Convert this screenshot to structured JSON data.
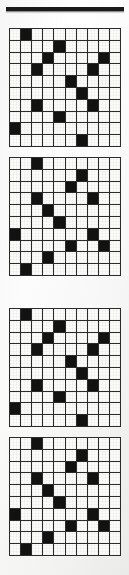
{
  "page": {
    "background_color": "#ffffff",
    "rule_color": "#1a1a1a"
  },
  "top_rule": {
    "label": "horizontal-rule"
  },
  "grid_defaults": {
    "rows": 10,
    "cols": 10,
    "filled_color": "#121212",
    "empty_color": "#fbfbfa",
    "line_color": "#2b2b2b"
  },
  "grids": [
    {
      "label": "grid-1",
      "pattern_name": "pattern-a",
      "rows": 10,
      "cols": 10,
      "filled_cells": [
        [
          0,
          1
        ],
        [
          1,
          4
        ],
        [
          2,
          3
        ],
        [
          2,
          8
        ],
        [
          3,
          2
        ],
        [
          3,
          7
        ],
        [
          4,
          5
        ],
        [
          5,
          6
        ],
        [
          6,
          2
        ],
        [
          6,
          7
        ],
        [
          7,
          4
        ],
        [
          8,
          0
        ],
        [
          9,
          6
        ]
      ]
    },
    {
      "label": "grid-2",
      "pattern_name": "pattern-b",
      "rows": 10,
      "cols": 10,
      "filled_cells": [
        [
          0,
          2
        ],
        [
          1,
          6
        ],
        [
          2,
          5
        ],
        [
          3,
          2
        ],
        [
          3,
          7
        ],
        [
          4,
          3
        ],
        [
          5,
          4
        ],
        [
          6,
          0
        ],
        [
          6,
          7
        ],
        [
          7,
          5
        ],
        [
          7,
          8
        ],
        [
          8,
          3
        ],
        [
          9,
          1
        ]
      ]
    },
    {
      "label": "grid-3",
      "pattern_name": "pattern-a",
      "rows": 10,
      "cols": 10,
      "filled_cells": [
        [
          0,
          1
        ],
        [
          1,
          4
        ],
        [
          2,
          3
        ],
        [
          2,
          8
        ],
        [
          3,
          2
        ],
        [
          3,
          7
        ],
        [
          4,
          5
        ],
        [
          5,
          6
        ],
        [
          6,
          2
        ],
        [
          6,
          7
        ],
        [
          7,
          4
        ],
        [
          8,
          0
        ],
        [
          9,
          6
        ]
      ]
    },
    {
      "label": "grid-4",
      "pattern_name": "pattern-b",
      "rows": 10,
      "cols": 10,
      "filled_cells": [
        [
          0,
          2
        ],
        [
          1,
          6
        ],
        [
          2,
          5
        ],
        [
          3,
          2
        ],
        [
          3,
          7
        ],
        [
          4,
          3
        ],
        [
          5,
          4
        ],
        [
          6,
          0
        ],
        [
          6,
          7
        ],
        [
          7,
          5
        ],
        [
          7,
          8
        ],
        [
          8,
          3
        ],
        [
          9,
          1
        ]
      ]
    }
  ]
}
